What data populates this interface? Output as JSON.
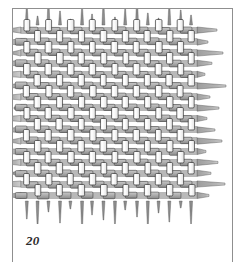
{
  "figure": {
    "number": "20",
    "subject_icon": "woven-textile-swatch",
    "frame": {
      "style": "open-rule-frame",
      "color": "#8f8f8f",
      "sides": [
        "top",
        "left",
        "right"
      ]
    },
    "artwork": {
      "type": "plain-weave-fabric-diagram",
      "warp_count": 16,
      "weft_count": 16,
      "cell_size_px": 11,
      "weave_origin_x": 8,
      "weave_origin_y": 16,
      "warp_color": "#ffffff",
      "warp_outline_color": "#1a1a1a",
      "weft_color": "#b0b0b0",
      "weft_shade_color": "#8c8c8c",
      "weft_outline_color": "#3a3a3a",
      "fringe_color": "#a8a8a8",
      "fringe_outline_color": "#4a4a4a",
      "background_color": "#ffffff",
      "warp_fringe_lengths_top": [
        22,
        9,
        27,
        14,
        6,
        20,
        11,
        25,
        8,
        17,
        29,
        12,
        7,
        23,
        15,
        10
      ],
      "warp_fringe_lengths_bottom": [
        18,
        27,
        11,
        22,
        8,
        30,
        14,
        19,
        25,
        9,
        16,
        28,
        12,
        21,
        7,
        24
      ],
      "weft_fringe_lengths_left": [
        14,
        24,
        9,
        19,
        30,
        12,
        21,
        7,
        26,
        16,
        11,
        23,
        18,
        8,
        27,
        13
      ],
      "weft_fringe_lengths_right": [
        20,
        11,
        26,
        15,
        8,
        29,
        13,
        22,
        10,
        18,
        25,
        9,
        21,
        14,
        28,
        12
      ]
    }
  }
}
